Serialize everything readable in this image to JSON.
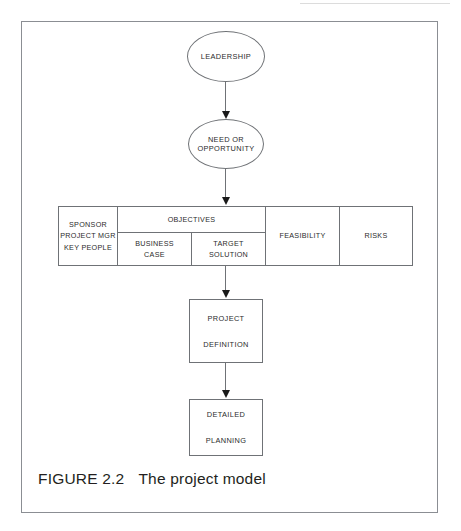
{
  "figure": {
    "caption_label": "FIGURE 2.2",
    "caption_text": "The project model"
  },
  "diagram": {
    "nodes": {
      "leadership": {
        "label": "LEADERSHIP"
      },
      "need": {
        "line1": "NEED OR",
        "line2": "OPPORTUNITY"
      },
      "project_definition": {
        "line1": "PROJECT",
        "line2": "DEFINITION"
      },
      "detailed_planning": {
        "line1": "DETAILED",
        "line2": "PLANNING"
      }
    },
    "table": {
      "people_column": {
        "line1": "SPONSOR",
        "line2": "PROJECT MGR",
        "line3": "KEY PEOPLE"
      },
      "objectives_column": {
        "header": "OBJECTIVES",
        "sub_left_line1": "BUSINESS",
        "sub_left_line2": "CASE",
        "sub_right_line1": "TARGET",
        "sub_right_line2": "SOLUTION"
      },
      "feasibility_column": {
        "label": "FEASIBILITY"
      },
      "risks_column": {
        "label": "RISKS"
      }
    },
    "flow_order": [
      "LEADERSHIP",
      "NEED OR OPPORTUNITY",
      "SPONSOR / OBJECTIVES / FEASIBILITY / RISKS",
      "PROJECT DEFINITION",
      "DETAILED PLANNING"
    ]
  },
  "colors": {
    "frame_border": "#8b8e93",
    "shape_border": "#6f7276",
    "arrow_fill": "#1a1a1a",
    "text": "#2b2b2b",
    "caption_text": "#231f20",
    "background": "#ffffff"
  }
}
